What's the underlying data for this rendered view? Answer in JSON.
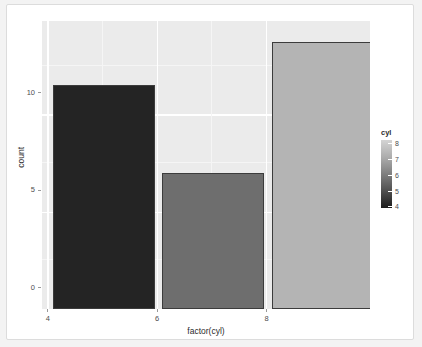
{
  "chart_data": {
    "type": "bar",
    "title": "",
    "subtitle": "",
    "xlabel": "factor(cyl)",
    "ylabel": "count",
    "categories": [
      "4",
      "6",
      "8"
    ],
    "values": [
      11.5,
      7,
      13.7
    ],
    "series": [
      {
        "name": "count",
        "values": [
          11.5,
          7,
          13.7
        ],
        "colors": [
          "#242424",
          "#6e6e6e",
          "#b4b4b4"
        ]
      }
    ],
    "xlim": [
      3,
      9
    ],
    "ylim": [
      0,
      14.8
    ],
    "x_tick_labels": [
      "4",
      "6",
      "8"
    ],
    "y_tick_labels": [
      "0",
      "5",
      "10"
    ],
    "y_tick_values": [
      0,
      5,
      10
    ],
    "grid": true,
    "grid_major": true,
    "grid_minor": true,
    "legend": {
      "position": "right",
      "type": "continuous-colorbar",
      "title": "cyl",
      "tick_labels": [
        "8",
        "7",
        "6",
        "5",
        "4"
      ],
      "tick_values": [
        8,
        7,
        6,
        5,
        4
      ],
      "gradient_top_color": "#d4d4d4",
      "gradient_bottom_color": "#1c1c1c"
    },
    "panel_background": "#ebebeb",
    "gridline_color": "#ffffff",
    "bar_outline_color": "#3c3c3c"
  },
  "axes": {
    "y_ticks": [
      {
        "label": "10",
        "value": 10
      },
      {
        "label": "5",
        "value": 5
      },
      {
        "label": "0",
        "value": 0
      }
    ],
    "x_ticks": [
      {
        "label": "4",
        "value": 4
      },
      {
        "label": "6",
        "value": 6
      },
      {
        "label": "8",
        "value": 8
      }
    ]
  },
  "bars": [
    {
      "category": "4",
      "count": 11.5,
      "color": "#242424"
    },
    {
      "category": "6",
      "count": 7,
      "color": "#6e6e6e"
    },
    {
      "category": "8",
      "count": 13.7,
      "color": "#b4b4b4"
    }
  ],
  "legend_ticks": [
    {
      "label": "8"
    },
    {
      "label": "7"
    },
    {
      "label": "6"
    },
    {
      "label": "5"
    },
    {
      "label": "4"
    }
  ]
}
